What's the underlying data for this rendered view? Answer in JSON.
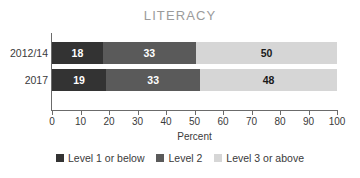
{
  "chart_data": {
    "type": "bar",
    "title": "LITERACY",
    "orientation": "horizontal",
    "stacked": true,
    "stack_mode": "percent",
    "xlabel": "Percent",
    "ylabel": "",
    "xlim": [
      0,
      100
    ],
    "xticks": [
      0,
      10,
      20,
      30,
      40,
      50,
      60,
      70,
      80,
      90,
      100
    ],
    "xtick_labels": [
      "0",
      "10",
      "20",
      "30",
      "40",
      "50",
      "60",
      "70",
      "80",
      "90",
      "100"
    ],
    "grid": false,
    "legend_position": "bottom",
    "categories": [
      "2012/14",
      "2017"
    ],
    "series": [
      {
        "name": "Level 1 or below",
        "color": "#333333",
        "values": [
          18,
          19
        ]
      },
      {
        "name": "Level 2",
        "color": "#5a5a5a",
        "values": [
          33,
          33
        ]
      },
      {
        "name": "Level 3 or above",
        "color": "#d6d6d6",
        "values": [
          50,
          48
        ]
      }
    ],
    "bar_labels": [
      [
        "18",
        "33",
        "50"
      ],
      [
        "19",
        "33",
        "48"
      ]
    ],
    "colors": {
      "title": "#9b9b9b",
      "axis": "#6b6b6b",
      "text": "#3a3a3a",
      "level1": "#333333",
      "level2": "#5a5a5a",
      "level3": "#d6d6d6",
      "background": "#ffffff"
    }
  }
}
